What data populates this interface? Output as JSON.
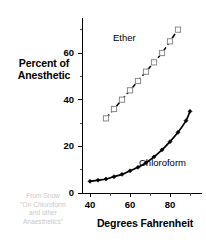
{
  "chart_data": {
    "type": "line",
    "title": "",
    "subtitle": "",
    "xlabel": "Degrees Fahrenheit",
    "ylabel": "Percent of Anesthetic",
    "ylabel_lines": [
      "Percent of",
      "Anesthetic"
    ],
    "xlim": [
      36,
      96
    ],
    "ylim": [
      0,
      75
    ],
    "grid": false,
    "legend_position": "inline",
    "x_ticks": [
      40,
      60,
      80
    ],
    "x_tick_labels": [
      "40",
      "60",
      "80"
    ],
    "x_minor_ticks": [
      50,
      70,
      90
    ],
    "y_ticks": [
      0,
      20,
      40,
      60
    ],
    "y_tick_labels": [
      "0",
      "20",
      "40",
      "60"
    ],
    "y_minor_ticks": [
      10,
      30,
      50,
      70
    ],
    "series": [
      {
        "name": "Chloroform",
        "label": "Chloroform",
        "style": "solid",
        "marker": "filled-diamond",
        "color": "#000000",
        "x": [
          40,
          44,
          48,
          52,
          56,
          60,
          64,
          68,
          72,
          76,
          80,
          84,
          88,
          90
        ],
        "values": [
          5,
          5.5,
          6,
          7,
          8,
          9.5,
          11,
          13,
          15.5,
          18.5,
          22,
          26,
          31,
          35
        ]
      },
      {
        "name": "Ether",
        "label": "Ether",
        "style": "dashed",
        "marker": "open-square",
        "color": "#000000",
        "x": [
          48,
          52,
          56,
          60,
          64,
          68,
          72,
          76,
          80,
          84
        ],
        "values": [
          32,
          36,
          40,
          44,
          48,
          52,
          56,
          60,
          65,
          70
        ]
      }
    ],
    "annotations": [
      {
        "text": "Ether",
        "x": 58,
        "y": 64
      },
      {
        "text": "Chloroform",
        "x": 74,
        "y": 15
      }
    ]
  },
  "attribution": {
    "lines": [
      "From Snow",
      "\"On Chloroform",
      "and other",
      "Anaesthetics\""
    ]
  },
  "colors": {
    "background": "#ffffff",
    "axis": "#000000",
    "chloroform": "#000000",
    "ether": "#000000",
    "attribution_text": "#c9c9c9"
  }
}
